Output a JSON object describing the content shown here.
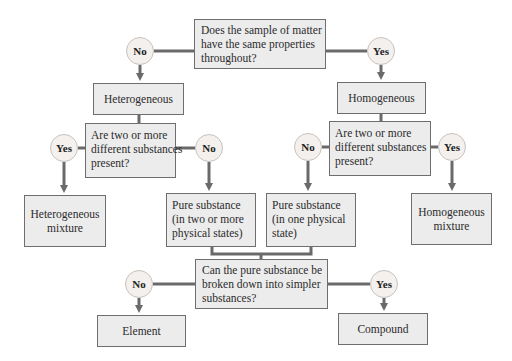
{
  "diagram": {
    "type": "flowchart",
    "colors": {
      "box_fill": "#ececec",
      "box_border": "#6e6e6e",
      "connector": "#6a6a6a",
      "circle_fill": "#f3f0ee",
      "circle_border": "#c9c2bd"
    },
    "q1": {
      "lines": [
        "Does the sample of matter",
        "have the same properties",
        "throughout?"
      ],
      "no_label": "No",
      "yes_label": "Yes"
    },
    "heterogeneous": {
      "label": "Heterogeneous"
    },
    "homogeneous": {
      "label": "Homogeneous"
    },
    "q2_left": {
      "lines": [
        "Are two or more",
        "different substances",
        "present?"
      ],
      "yes_label": "Yes",
      "no_label": "No"
    },
    "q2_right": {
      "lines": [
        "Are two or more",
        "different substances",
        "present?"
      ],
      "no_label": "No",
      "yes_label": "Yes"
    },
    "heterogeneous_mixture": {
      "lines": [
        "Heterogeneous",
        "mixture"
      ]
    },
    "pure_two_states": {
      "lines": [
        "Pure substance",
        "(in two or more",
        "physical states)"
      ]
    },
    "pure_one_state": {
      "lines": [
        "Pure substance",
        "(in one physical",
        "state)"
      ]
    },
    "homogeneous_mixture": {
      "lines": [
        "Homogeneous",
        "mixture"
      ]
    },
    "q3": {
      "lines": [
        "Can the pure substance be",
        "broken down into simpler",
        "substances?"
      ],
      "no_label": "No",
      "yes_label": "Yes"
    },
    "element": {
      "label": "Element"
    },
    "compound": {
      "label": "Compound"
    }
  }
}
